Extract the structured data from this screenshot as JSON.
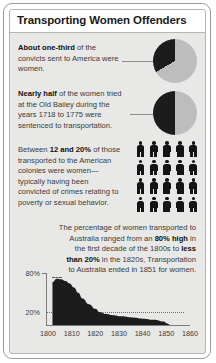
{
  "title": "Transporting Women Offenders",
  "blocks": [
    {
      "id": "convicts-to-america",
      "lead": "About one-third",
      "rest": " of the convicts sent to America were women."
    },
    {
      "id": "old-bailey",
      "lead": "Nearly half",
      "rest": " of the women tried at the Old Bailey during the years 1718 to 1775 were sentenced to transportation."
    },
    {
      "id": "american-colonies",
      "pre": "Between ",
      "lead": "12 and 20%",
      "rest": " of those transported to the American colonies were women—typically having been convicted of crimes relating to poverty or sexual behavior."
    },
    {
      "id": "australia-percentage",
      "pre": "The percentage of women transported to Australia ranged from an ",
      "lead": "80% high",
      "mid": " in the first decade of the 1800s to ",
      "lead2": "less than 20%",
      "rest": " in the 1820s, Transportation to Australia ended in 1851 for women."
    }
  ],
  "pies": [
    {
      "name": "convicts-america-pie",
      "dark_share": 33,
      "light_share": 67
    },
    {
      "name": "old-bailey-pie",
      "dark_share": 50,
      "light_share": 50
    }
  ],
  "pictogram": {
    "name": "women-transported-pictogram",
    "columns": 5,
    "rows": 4,
    "total_figures": 20,
    "figure_icon": "person-icon"
  },
  "chart_data": {
    "type": "area",
    "title": "Percentage of women transported to Australia",
    "xlabel": "",
    "ylabel": "",
    "ylim": [
      0,
      90
    ],
    "xlim": [
      1795,
      1862
    ],
    "grid": true,
    "legend": null,
    "ytick_labels": [
      "80%",
      "20%"
    ],
    "ytick_values": [
      80,
      20
    ],
    "xtick_labels": [
      "1800",
      "1810",
      "1820",
      "1830",
      "1840",
      "1850",
      "1860"
    ],
    "xtick_values": [
      1800,
      1810,
      1820,
      1830,
      1840,
      1850,
      1860
    ],
    "x": [
      1798,
      1800,
      1802,
      1804,
      1806,
      1808,
      1810,
      1812,
      1815,
      1818,
      1820,
      1823,
      1826,
      1830,
      1835,
      1840,
      1845,
      1850,
      1851,
      1853
    ],
    "values": [
      74,
      80,
      79,
      76,
      72,
      65,
      56,
      46,
      36,
      28,
      22,
      19,
      17,
      15,
      13,
      11,
      9,
      6,
      3,
      0
    ],
    "fill_color": "#1c1c1c"
  },
  "colors": {
    "dark": "#1c1c1c",
    "light": "#bdbdbd",
    "panel": "#e8e8e6",
    "frame": "#9a9a9a",
    "text": "#3b3b3b"
  }
}
